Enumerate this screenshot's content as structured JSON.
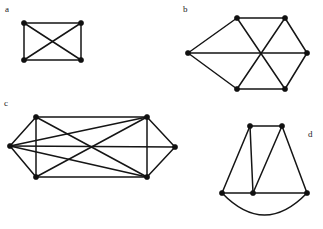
{
  "figure": {
    "width": 323,
    "height": 229,
    "background_color": "#ffffff",
    "ink_color": "#151515",
    "vertex_color": "#101010"
  },
  "labels": {
    "a": "a",
    "b": "b",
    "c": "c",
    "d": "d"
  },
  "label_positions": {
    "a": {
      "x": 5,
      "y": 5
    },
    "b": {
      "x": 183,
      "y": 5
    },
    "c": {
      "x": 4,
      "y": 99
    },
    "d": {
      "x": 308,
      "y": 130
    }
  },
  "graphs": [
    {
      "id": "a",
      "label": "a",
      "name": "complete-graph-k4-rectangle",
      "vertex_count": 4,
      "edge_count": 6,
      "vertices": [
        {
          "id": "a1",
          "name": "top-left",
          "x": 24,
          "y": 23
        },
        {
          "id": "a2",
          "name": "top-right",
          "x": 81,
          "y": 23
        },
        {
          "id": "a3",
          "name": "bottom-left",
          "x": 24,
          "y": 60
        },
        {
          "id": "a4",
          "name": "bottom-right",
          "x": 81,
          "y": 60
        }
      ],
      "edges": [
        {
          "from": "a1",
          "to": "a2",
          "kind": "line"
        },
        {
          "from": "a1",
          "to": "a3",
          "kind": "line"
        },
        {
          "from": "a2",
          "to": "a4",
          "kind": "line"
        },
        {
          "from": "a3",
          "to": "a4",
          "kind": "line"
        },
        {
          "from": "a1",
          "to": "a4",
          "kind": "line"
        },
        {
          "from": "a2",
          "to": "a3",
          "kind": "line"
        }
      ]
    },
    {
      "id": "b",
      "label": "b",
      "name": "hexagon-with-three-long-diagonals",
      "vertex_count": 6,
      "edge_count": 9,
      "vertices": [
        {
          "id": "b1",
          "name": "top-left",
          "x": 237,
          "y": 18
        },
        {
          "id": "b2",
          "name": "top-right",
          "x": 285,
          "y": 18
        },
        {
          "id": "b3",
          "name": "right",
          "x": 307,
          "y": 53
        },
        {
          "id": "b4",
          "name": "bottom-right",
          "x": 285,
          "y": 89
        },
        {
          "id": "b5",
          "name": "bottom-left",
          "x": 237,
          "y": 89
        },
        {
          "id": "b6",
          "name": "left",
          "x": 188,
          "y": 53
        }
      ],
      "edges": [
        {
          "from": "b1",
          "to": "b2",
          "kind": "line"
        },
        {
          "from": "b2",
          "to": "b3",
          "kind": "line"
        },
        {
          "from": "b3",
          "to": "b4",
          "kind": "line"
        },
        {
          "from": "b4",
          "to": "b5",
          "kind": "line"
        },
        {
          "from": "b5",
          "to": "b6",
          "kind": "line"
        },
        {
          "from": "b6",
          "to": "b1",
          "kind": "line"
        },
        {
          "from": "b1",
          "to": "b4",
          "kind": "line"
        },
        {
          "from": "b2",
          "to": "b5",
          "kind": "line"
        },
        {
          "from": "b3",
          "to": "b6",
          "kind": "line"
        }
      ]
    },
    {
      "id": "c",
      "label": "c",
      "name": "six-vertex-graph-rectangle-with-two-apexes",
      "vertex_count": 6,
      "edge_count": 11,
      "vertices": [
        {
          "id": "c1",
          "name": "left-apex",
          "x": 10,
          "y": 146
        },
        {
          "id": "c2",
          "name": "top-left",
          "x": 36,
          "y": 117
        },
        {
          "id": "c3",
          "name": "top-right",
          "x": 147,
          "y": 117
        },
        {
          "id": "c4",
          "name": "right-apex",
          "x": 175,
          "y": 147
        },
        {
          "id": "c5",
          "name": "bottom-right",
          "x": 147,
          "y": 177
        },
        {
          "id": "c6",
          "name": "bottom-left",
          "x": 36,
          "y": 177
        }
      ],
      "edges": [
        {
          "from": "c1",
          "to": "c2",
          "kind": "line"
        },
        {
          "from": "c1",
          "to": "c6",
          "kind": "line"
        },
        {
          "from": "c2",
          "to": "c3",
          "kind": "line"
        },
        {
          "from": "c2",
          "to": "c6",
          "kind": "line"
        },
        {
          "from": "c3",
          "to": "c4",
          "kind": "line"
        },
        {
          "from": "c3",
          "to": "c5",
          "kind": "line"
        },
        {
          "from": "c4",
          "to": "c5",
          "kind": "line"
        },
        {
          "from": "c5",
          "to": "c6",
          "kind": "line"
        },
        {
          "from": "c1",
          "to": "c4",
          "kind": "line"
        },
        {
          "from": "c2",
          "to": "c5",
          "kind": "line"
        },
        {
          "from": "c3",
          "to": "c6",
          "kind": "line"
        },
        {
          "from": "c1",
          "to": "c3",
          "kind": "line"
        },
        {
          "from": "c1",
          "to": "c5",
          "kind": "line"
        }
      ]
    },
    {
      "id": "d",
      "label": "d",
      "name": "five-vertex-graph-with-curved-bottom-arc",
      "vertex_count": 5,
      "edge_count": 8,
      "vertices": [
        {
          "id": "d1",
          "name": "top-left",
          "x": 250,
          "y": 126
        },
        {
          "id": "d2",
          "name": "top-right",
          "x": 282,
          "y": 126
        },
        {
          "id": "d3",
          "name": "bottom-left",
          "x": 222,
          "y": 193
        },
        {
          "id": "d4",
          "name": "bottom-middle",
          "x": 253,
          "y": 193
        },
        {
          "id": "d5",
          "name": "bottom-right",
          "x": 307,
          "y": 193
        }
      ],
      "edges": [
        {
          "from": "d1",
          "to": "d2",
          "kind": "line"
        },
        {
          "from": "d1",
          "to": "d3",
          "kind": "line"
        },
        {
          "from": "d1",
          "to": "d4",
          "kind": "line"
        },
        {
          "from": "d2",
          "to": "d4",
          "kind": "line"
        },
        {
          "from": "d2",
          "to": "d5",
          "kind": "line"
        },
        {
          "from": "d3",
          "to": "d4",
          "kind": "line"
        },
        {
          "from": "d4",
          "to": "d5",
          "kind": "line"
        },
        {
          "from": "d3",
          "to": "d5",
          "kind": "arc",
          "note": "curved arc bowing downward below the baseline, clipped by the page edge"
        }
      ]
    }
  ]
}
